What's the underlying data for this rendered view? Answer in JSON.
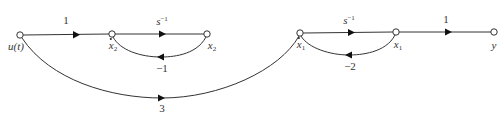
{
  "diagram": {
    "type": "signal-flow-graph",
    "nodes": [
      {
        "id": "u",
        "label": "u(t)"
      },
      {
        "id": "x2dot",
        "label_base": "x",
        "label_sub": "2",
        "dotted": true
      },
      {
        "id": "x2",
        "label_base": "x",
        "label_sub": "2",
        "dotted": false
      },
      {
        "id": "x1dot",
        "label_base": "x",
        "label_sub": "1",
        "dotted": true
      },
      {
        "id": "x1",
        "label_base": "x",
        "label_sub": "1",
        "dotted": false
      },
      {
        "id": "y",
        "label": "y"
      }
    ],
    "branches": [
      {
        "from": "u",
        "to": "x2dot",
        "gain": "1"
      },
      {
        "from": "x2dot",
        "to": "x2",
        "gain_base": "s",
        "gain_exp": "−1"
      },
      {
        "from": "x2",
        "to": "x2dot",
        "gain": "−1"
      },
      {
        "from": "u",
        "to": "x1dot",
        "gain": "3"
      },
      {
        "from": "x1dot",
        "to": "x1",
        "gain_base": "s",
        "gain_exp": "−1"
      },
      {
        "from": "x1",
        "to": "x1dot",
        "gain": "−2"
      },
      {
        "from": "x1",
        "to": "y",
        "gain": "1"
      }
    ]
  }
}
